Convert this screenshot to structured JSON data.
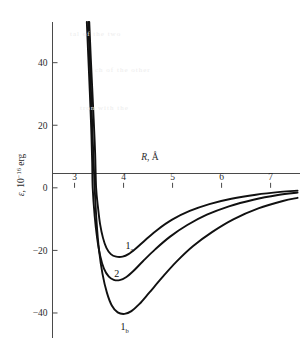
{
  "figure": {
    "background_color": "#ffffff",
    "curve_color": "#111111",
    "axis_color": "#4a4a4a"
  },
  "chart_data": {
    "type": "line",
    "title": "",
    "subtitle": "",
    "xlabel": "R, Å",
    "xlabel_symbol": "R",
    "xlabel_unit": "Å",
    "ylabel": "ε, 10⁻¹⁶ erg",
    "ylabel_symbol": "ε",
    "ylabel_unit_mantissa": "10",
    "ylabel_unit_exponent": "−16",
    "ylabel_unit_suffix": "erg",
    "xlim": [
      2.55,
      7.6
    ],
    "ylim": [
      -48,
      53
    ],
    "xticks": [
      3,
      4,
      5,
      6,
      7
    ],
    "xtick_labels": [
      "3",
      "4",
      "5",
      "6",
      "7"
    ],
    "yticks": [
      40,
      20,
      0,
      -20,
      -40
    ],
    "ytick_labels": [
      "40",
      "20",
      "0",
      "−20",
      "−40"
    ],
    "grid": false,
    "legend_position": "inline-annotations",
    "annotations": [
      {
        "name": "curve-label-1a",
        "text": "1",
        "subscript": "a",
        "x": 4.12,
        "y": -19.5
      },
      {
        "name": "curve-label-2",
        "text": "2",
        "subscript": "",
        "x": 3.86,
        "y": -28.5
      },
      {
        "name": "curve-label-1b",
        "text": "1",
        "subscript": "b",
        "x": 4.02,
        "y": -45.5
      }
    ],
    "series": [
      {
        "name": "1a",
        "label": "1ₐ",
        "well_depth": -22.0,
        "well_position": 3.98,
        "zero_crossing": 3.44,
        "points": [
          [
            3.3,
            53.0
          ],
          [
            3.33,
            42.0
          ],
          [
            3.36,
            32.0
          ],
          [
            3.39,
            22.0
          ],
          [
            3.42,
            11.0
          ],
          [
            3.44,
            0.0
          ],
          [
            3.48,
            -6.5
          ],
          [
            3.52,
            -11.5
          ],
          [
            3.58,
            -16.0
          ],
          [
            3.65,
            -19.2
          ],
          [
            3.74,
            -21.2
          ],
          [
            3.85,
            -22.0
          ],
          [
            3.98,
            -22.0
          ],
          [
            4.1,
            -21.2
          ],
          [
            4.25,
            -19.4
          ],
          [
            4.45,
            -16.6
          ],
          [
            4.7,
            -13.3
          ],
          [
            5.0,
            -10.1
          ],
          [
            5.35,
            -7.4
          ],
          [
            5.75,
            -5.2
          ],
          [
            6.2,
            -3.5
          ],
          [
            6.7,
            -2.2
          ],
          [
            7.2,
            -1.3
          ],
          [
            7.55,
            -0.9
          ]
        ]
      },
      {
        "name": "2",
        "label": "2",
        "well_depth": -29.5,
        "well_position": 3.92,
        "zero_crossing": 3.37,
        "points": [
          [
            3.25,
            53.0
          ],
          [
            3.28,
            42.0
          ],
          [
            3.31,
            31.0
          ],
          [
            3.34,
            19.0
          ],
          [
            3.36,
            8.0
          ],
          [
            3.37,
            0.0
          ],
          [
            3.41,
            -9.0
          ],
          [
            3.46,
            -16.0
          ],
          [
            3.52,
            -21.5
          ],
          [
            3.6,
            -25.8
          ],
          [
            3.7,
            -28.4
          ],
          [
            3.8,
            -29.4
          ],
          [
            3.92,
            -29.5
          ],
          [
            4.05,
            -28.6
          ],
          [
            4.2,
            -26.6
          ],
          [
            4.4,
            -23.4
          ],
          [
            4.65,
            -19.6
          ],
          [
            4.95,
            -15.6
          ],
          [
            5.3,
            -11.9
          ],
          [
            5.7,
            -8.6
          ],
          [
            6.15,
            -5.9
          ],
          [
            6.65,
            -3.8
          ],
          [
            7.15,
            -2.3
          ],
          [
            7.55,
            -1.5
          ]
        ]
      },
      {
        "name": "1b",
        "label": "1_b",
        "well_depth": -40.3,
        "well_position": 4.02,
        "zero_crossing": 3.41,
        "points": [
          [
            3.28,
            53.0
          ],
          [
            3.31,
            41.0
          ],
          [
            3.34,
            29.0
          ],
          [
            3.37,
            16.0
          ],
          [
            3.4,
            4.0
          ],
          [
            3.41,
            0.0
          ],
          [
            3.45,
            -11.0
          ],
          [
            3.5,
            -20.0
          ],
          [
            3.57,
            -27.5
          ],
          [
            3.66,
            -33.5
          ],
          [
            3.76,
            -37.6
          ],
          [
            3.88,
            -39.8
          ],
          [
            4.02,
            -40.3
          ],
          [
            4.16,
            -39.4
          ],
          [
            4.32,
            -37.2
          ],
          [
            4.52,
            -33.6
          ],
          [
            4.78,
            -28.8
          ],
          [
            5.08,
            -23.6
          ],
          [
            5.42,
            -18.6
          ],
          [
            5.82,
            -14.0
          ],
          [
            6.25,
            -10.0
          ],
          [
            6.75,
            -6.6
          ],
          [
            7.25,
            -4.2
          ],
          [
            7.55,
            -3.2
          ]
        ]
      }
    ]
  },
  "bleed_through": {
    "lines": [
      "tal of the two",
      "ch of the other",
      "tron with the"
    ]
  }
}
